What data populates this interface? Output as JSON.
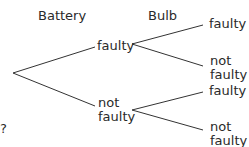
{
  "diagram": {
    "type": "probability-tree",
    "headers": {
      "battery": "Battery",
      "bulb": "Bulb"
    },
    "level1": [
      {
        "label_line1": "faulty",
        "label_line2": ""
      },
      {
        "label_line1": "not",
        "label_line2": "faulty"
      }
    ],
    "level2": [
      {
        "label_line1": "faulty",
        "label_line2": ""
      },
      {
        "label_line1": "not",
        "label_line2": "faulty"
      },
      {
        "label_line1": "faulty",
        "label_line2": ""
      },
      {
        "label_line1": "not",
        "label_line2": "faulty"
      }
    ],
    "side_mark": "?",
    "line_color": "#333333"
  }
}
